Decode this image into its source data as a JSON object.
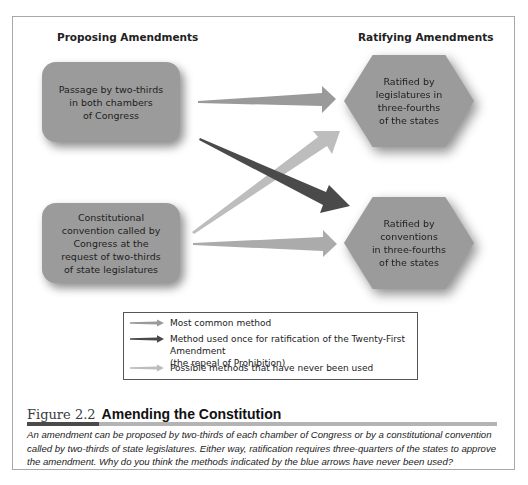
{
  "diagram": {
    "headers": {
      "proposing": "Proposing Amendments",
      "ratifying": "Ratifying Amendments"
    },
    "proposal_methods": [
      {
        "text": "Passage by two-thirds in both chambers of Congress",
        "lines": [
          "Passage by two-thirds",
          "in both chambers",
          "of Congress"
        ]
      },
      {
        "text": "Constitutional convention called by Congress at the request of two-thirds of state legislatures",
        "lines": [
          "Constitutional",
          "convention called by",
          "Congress at the",
          "request of two-thirds",
          "of state legislatures"
        ]
      }
    ],
    "ratification_methods": [
      {
        "text": "Ratified by legislatures in three-fourths of the states",
        "lines": [
          "Ratified by",
          "legislatures in",
          "three-fourths",
          "of the states"
        ]
      },
      {
        "text": "Ratified by conventions in three-fourths of the states",
        "lines": [
          "Ratified by",
          "conventions",
          "in three-fourths",
          "of the states"
        ]
      }
    ],
    "arrows": [
      {
        "from": "congress",
        "to": "legislatures",
        "type": "most-common",
        "color": "#9a9a9a"
      },
      {
        "from": "congress",
        "to": "conventions",
        "type": "used-once",
        "color": "#4a4a4a"
      },
      {
        "from": "convention",
        "to": "legislatures",
        "type": "never-used",
        "color": "#bdbdbd"
      },
      {
        "from": "convention",
        "to": "conventions",
        "type": "never-used",
        "color": "#ababab"
      }
    ]
  },
  "legend": {
    "items": [
      {
        "label": "Most common method",
        "color": "#9a9a9a"
      },
      {
        "label_line1": "Method used once for ratification of the Twenty-First Amendment",
        "label_line2": "(the repeal of Prohibition)",
        "color": "#4a4a4a"
      },
      {
        "label": "Possible methods that have never been used",
        "color": "#bdbdbd"
      }
    ]
  },
  "figure": {
    "number": "Figure 2.2",
    "title": "Amending the Constitution",
    "caption": "An amendment can be proposed by two-thirds of each chamber of Congress or by a constitutional convention called by two-thirds of state legislatures. Either way, ratification requires three-quarters of the states to approve the amendment. Why do you think the methods indicated by the blue arrows have never been used?"
  }
}
